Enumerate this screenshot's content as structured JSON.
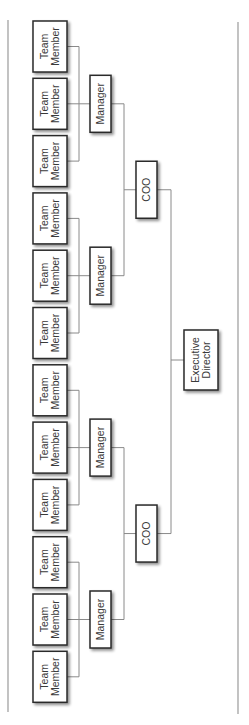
{
  "diagram": {
    "type": "org-chart",
    "orientation": "rotated-90-ccw",
    "colors": {
      "box_border": "#2a2a2a",
      "connector": "#8a8a8a",
      "text": "#3a3a3a",
      "background": "#ffffff"
    },
    "root": {
      "id": "ed",
      "label": [
        "Executive",
        "Director"
      ],
      "children": [
        {
          "id": "coo1",
          "label": [
            "COO"
          ],
          "children": [
            {
              "id": "mgr1",
              "label": [
                "Manager"
              ],
              "children": [
                {
                  "id": "tm1",
                  "label": [
                    "Team",
                    "Member"
                  ]
                },
                {
                  "id": "tm2",
                  "label": [
                    "Team",
                    "Member"
                  ]
                },
                {
                  "id": "tm3",
                  "label": [
                    "Team",
                    "Member"
                  ]
                }
              ]
            },
            {
              "id": "mgr2",
              "label": [
                "Manager"
              ],
              "children": [
                {
                  "id": "tm4",
                  "label": [
                    "Team",
                    "Member"
                  ]
                },
                {
                  "id": "tm5",
                  "label": [
                    "Team",
                    "Member"
                  ]
                },
                {
                  "id": "tm6",
                  "label": [
                    "Team",
                    "Member"
                  ]
                }
              ]
            }
          ]
        },
        {
          "id": "coo2",
          "label": [
            "COO"
          ],
          "children": [
            {
              "id": "mgr3",
              "label": [
                "Manager"
              ],
              "children": [
                {
                  "id": "tm7",
                  "label": [
                    "Team",
                    "Member"
                  ]
                },
                {
                  "id": "tm8",
                  "label": [
                    "Team",
                    "Member"
                  ]
                },
                {
                  "id": "tm9",
                  "label": [
                    "Team",
                    "Member"
                  ]
                }
              ]
            },
            {
              "id": "mgr4",
              "label": [
                "Manager"
              ],
              "children": [
                {
                  "id": "tm10",
                  "label": [
                    "Team",
                    "Member"
                  ]
                },
                {
                  "id": "tm11",
                  "label": [
                    "Team",
                    "Member"
                  ]
                },
                {
                  "id": "tm12",
                  "label": [
                    "Team",
                    "Member"
                  ]
                }
              ]
            }
          ]
        }
      ]
    }
  }
}
